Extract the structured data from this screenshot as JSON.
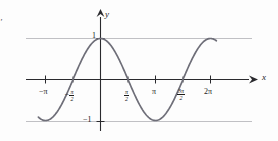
{
  "figure": {
    "kind": "cosine-graph",
    "curve_color": "#6e6e78",
    "axis_color": "#1b1b1b",
    "grid_color": "#b9b9bd",
    "background": "#fdfdfd"
  },
  "axes": {
    "x_label": "x",
    "y_label": "y",
    "x_ticks": [
      {
        "label": "−π",
        "value": -3.14159,
        "type": "plain"
      },
      {
        "label": "−π/2",
        "value": -1.5708,
        "type": "fraction",
        "lead": "−",
        "num": "π",
        "den": "2"
      },
      {
        "label": "π/2",
        "value": 1.5708,
        "type": "fraction",
        "lead": "",
        "num": "π",
        "den": "2"
      },
      {
        "label": "π",
        "value": 3.14159,
        "type": "plain"
      },
      {
        "label": "3π/2",
        "value": 4.71239,
        "type": "fraction",
        "lead": "",
        "num": "3π",
        "den": "2"
      },
      {
        "label": "2π",
        "value": 6.28319,
        "type": "plain"
      }
    ],
    "y_ticks": [
      {
        "label": "1",
        "value": 1
      },
      {
        "label": "−1",
        "value": -1
      }
    ],
    "x_range": [
      -4.0,
      7.2
    ],
    "y_range": [
      -1.35,
      1.35
    ]
  },
  "chart_data": {
    "type": "line",
    "title": "",
    "xlabel": "x",
    "ylabel": "y",
    "grid": true,
    "legend": "none",
    "xlim": [
      -4.0,
      7.2
    ],
    "ylim": [
      -1.35,
      1.35
    ],
    "xtick_labels": [
      "−π",
      "−π/2",
      "π/2",
      "π",
      "3π/2",
      "2π"
    ],
    "xtick_values": [
      -3.14159,
      -1.5708,
      1.5708,
      3.14159,
      4.71239,
      6.28319
    ],
    "ytick_labels": [
      "1",
      "−1"
    ],
    "ytick_values": [
      1,
      -1
    ],
    "series": [
      {
        "name": "y = cos x",
        "function": "cos",
        "amplitude": 1,
        "period": 6.28319,
        "phase": 0,
        "x_start": -3.55,
        "x_end": 6.62,
        "key_points": [
          {
            "x": -3.14159,
            "y": -1.0,
            "note": "minimum"
          },
          {
            "x": -1.5708,
            "y": 0.0,
            "note": "zero"
          },
          {
            "x": 0.0,
            "y": 1.0,
            "note": "maximum"
          },
          {
            "x": 1.5708,
            "y": 0.0,
            "note": "zero"
          },
          {
            "x": 3.14159,
            "y": -1.0,
            "note": "minimum"
          },
          {
            "x": 4.71239,
            "y": 0.0,
            "note": "zero"
          },
          {
            "x": 6.28319,
            "y": 1.0,
            "note": "maximum"
          }
        ]
      }
    ],
    "gridlines_horizontal": [
      1,
      -1
    ]
  },
  "margin_marks": {
    "top_left_tick": "′"
  }
}
